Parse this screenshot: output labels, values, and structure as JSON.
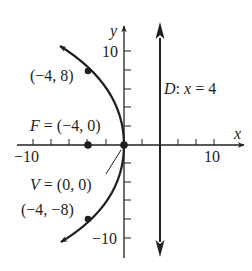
{
  "diagram": {
    "type": "parabola-graph",
    "equation": "y^2 = -16x",
    "axes": {
      "x_label": "x",
      "y_label": "y",
      "x_range": [
        -11.7,
        13.3
      ],
      "y_range": [
        -12,
        12.8
      ],
      "tick_step": 2,
      "x_tick_labels": [
        "−10",
        "10"
      ],
      "y_tick_labels": [
        "10",
        "−10"
      ]
    },
    "points": [
      {
        "id": "upper",
        "label": "(−4, 8)",
        "x": -4,
        "y": 8
      },
      {
        "id": "focus",
        "label": "F = (−4, 0)",
        "x": -4,
        "y": 0
      },
      {
        "id": "vertex",
        "label": "V = (0, 0)",
        "x": 0,
        "y": 0
      },
      {
        "id": "lower",
        "label": "(−4, −8)",
        "x": -4,
        "y": -8
      }
    ],
    "directrix": {
      "label": "D: x = 4",
      "x": 4
    },
    "colors": {
      "ink": "#231f20",
      "background": "#ffffff"
    }
  },
  "labels": {
    "x_axis": "x",
    "y_axis": "y",
    "x_neg10": "−10",
    "x_pos10": "10",
    "y_pos10": "10",
    "y_neg10": "−10",
    "upper_point": "(−4, 8)",
    "focus": "F = (−4, 0)",
    "vertex": "V = (0, 0)",
    "lower_point": "(−4, −8)",
    "directrix": "D: x = 4"
  }
}
